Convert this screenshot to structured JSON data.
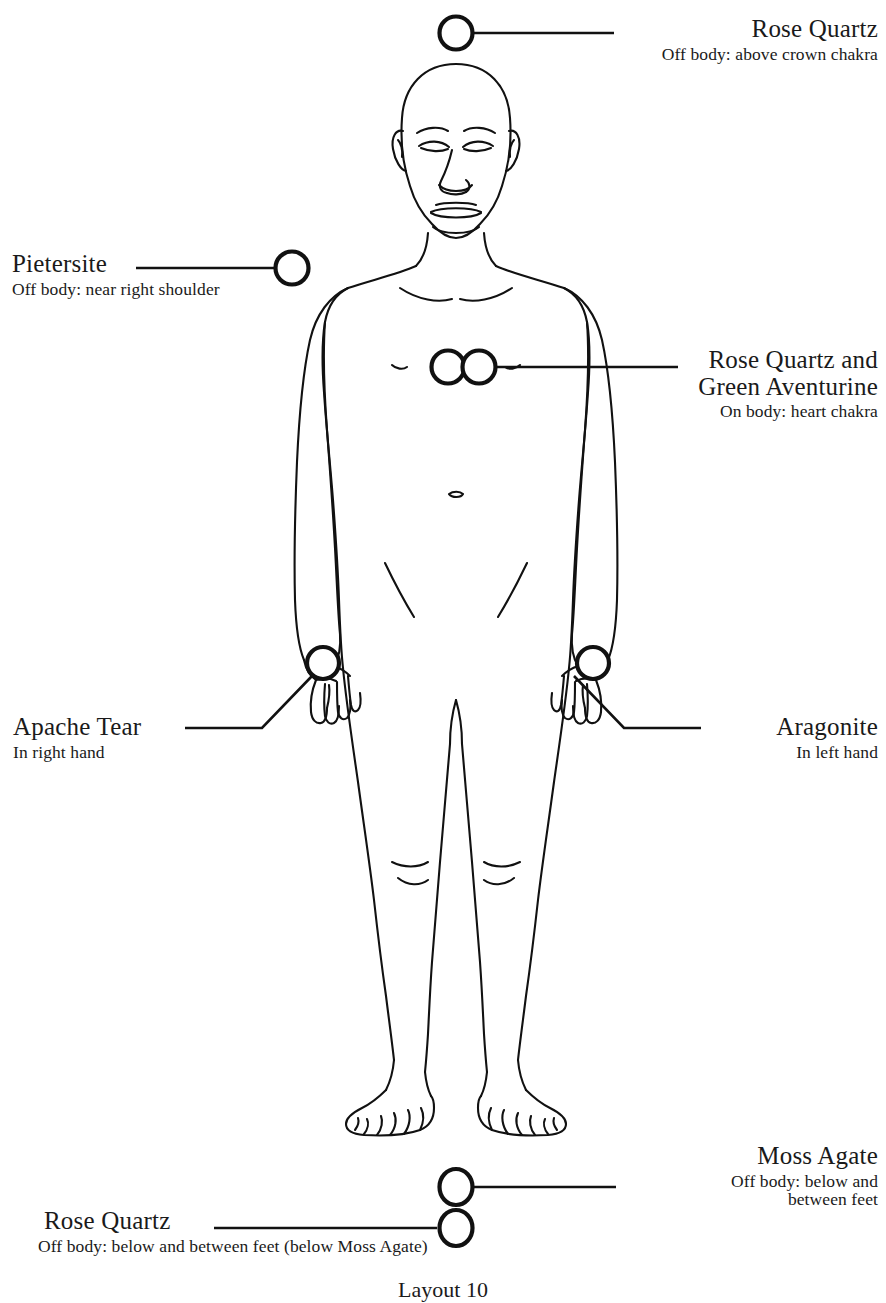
{
  "diagram": {
    "figure": "front-facing nude human figure line drawing, bald, eyes closed, arms at sides",
    "stroke_color": "#111111",
    "background_color": "#ffffff",
    "caption": "Layout 10"
  },
  "markers": [
    {
      "id": "crown",
      "name": "Rose Quartz",
      "placement": "Off body: above crown chakra",
      "circles": 1,
      "align": "right"
    },
    {
      "id": "right-shoulder",
      "name": "Pietersite",
      "placement": "Off body: near right shoulder",
      "circles": 1,
      "align": "left"
    },
    {
      "id": "heart",
      "name": "Rose Quartz and Green Aventurine",
      "name_line1": "Rose Quartz and",
      "name_line2": "Green Aventurine",
      "placement": "On body: heart chakra",
      "circles": 2,
      "align": "right"
    },
    {
      "id": "right-hand",
      "name": "Apache Tear",
      "placement": "In right hand",
      "circles": 1,
      "align": "left"
    },
    {
      "id": "left-hand",
      "name": "Aragonite",
      "placement": "In left hand",
      "circles": 1,
      "align": "right"
    },
    {
      "id": "below-feet-upper",
      "name": "Moss Agate",
      "placement_line1": "Off body: below and",
      "placement_line2": "between feet",
      "placement": "Off body: below and between feet",
      "circles": 1,
      "align": "right"
    },
    {
      "id": "below-feet-lower",
      "name": "Rose Quartz",
      "placement": "Off body: below and between feet (below Moss Agate)",
      "circles": 1,
      "align": "left"
    }
  ]
}
